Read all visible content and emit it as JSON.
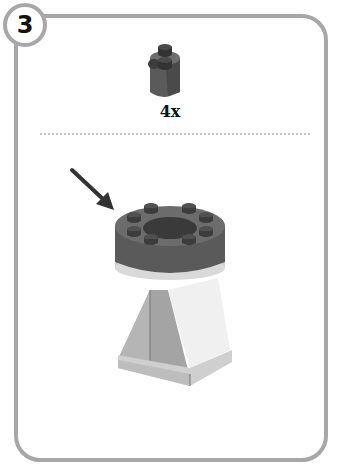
{
  "step": {
    "number": "3"
  },
  "parts_callout": {
    "part_name": "round-brick-1x1-2-stud",
    "quantity": "4x",
    "part_color": "#5c5c5c"
  },
  "assembly": {
    "arrow_color": "#333333",
    "ring_color": "#5e5e5e",
    "base_light_color": "#d9d9d9",
    "base_dark_color": "#a9a9a9",
    "base_white_color": "#f2f2f2"
  },
  "colors": {
    "frame": "#a7a7a7",
    "divider": "#c4c4c4"
  }
}
